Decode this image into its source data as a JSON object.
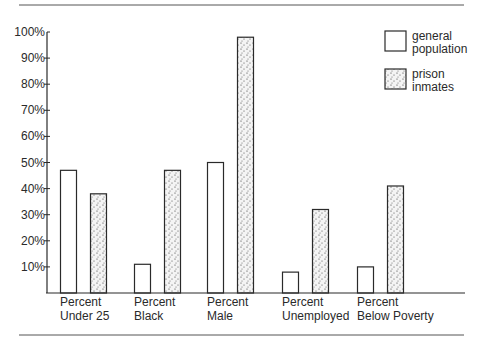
{
  "chart_data": {
    "type": "bar",
    "title": "",
    "xlabel": "",
    "ylabel": "",
    "ylim": [
      0,
      100
    ],
    "y_ticks": [
      "10%",
      "20%",
      "30%",
      "40%",
      "50%",
      "60%",
      "70%",
      "80%",
      "90%",
      "100%"
    ],
    "categories": [
      [
        "Percent",
        "Under 25"
      ],
      [
        "Percent",
        "Black"
      ],
      [
        "Percent",
        "Male"
      ],
      [
        "Percent",
        "Unemployed"
      ],
      [
        "Percent",
        "Below Poverty"
      ]
    ],
    "series": [
      {
        "name": "general population",
        "legend_lines": [
          "general",
          "population"
        ],
        "fill": "plain",
        "values": [
          47,
          11,
          50,
          8,
          10
        ]
      },
      {
        "name": "prison inmates",
        "legend_lines": [
          "prison",
          "inmates"
        ],
        "fill": "stipple",
        "values": [
          38,
          47,
          98,
          32,
          41
        ]
      }
    ],
    "grid": false,
    "legend_position": "top-right"
  },
  "colors": {
    "ink": "#2a2a2a",
    "background": "#ffffff",
    "stipple_fill": "#f2f2f2"
  }
}
